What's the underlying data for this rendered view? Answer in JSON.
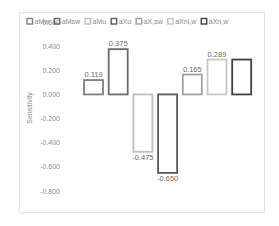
{
  "chart_data": {
    "type": "bar",
    "title": "",
    "xlabel": "",
    "ylabel": "Sensitivity",
    "ylim": [
      -0.8,
      0.6
    ],
    "yticks": [
      0.6,
      0.4,
      0.2,
      0.0,
      -0.2,
      -0.4,
      -0.6,
      -0.8
    ],
    "ytick_labels": [
      "0.600",
      "0.400",
      "0.200",
      "0.000",
      "-0.200",
      "-0.400",
      "-0.600",
      "-0.800"
    ],
    "grid": false,
    "legend_position": "top",
    "series": [
      {
        "name": "aMw",
        "value": 0.119,
        "label": "0.119",
        "color": "#7f7f7f"
      },
      {
        "name": "aMsw",
        "value": 0.375,
        "label": "0.375",
        "color": "#6b6b6b"
      },
      {
        "name": "aMu",
        "value": -0.475,
        "label": "-0.475",
        "color": "#bfbfbf"
      },
      {
        "name": "aXu",
        "value": -0.65,
        "label": "-0.650",
        "color": "#595959"
      },
      {
        "name": "aX,sw",
        "value": 0.165,
        "label": "0.165",
        "color": "#a0a0a0"
      },
      {
        "name": "aXnl,w",
        "value": 0.289,
        "label": "0.289",
        "color": "#c8c8c8"
      },
      {
        "name": "aXn,w",
        "value": 0.289,
        "label": "",
        "color": "#404040"
      }
    ]
  }
}
